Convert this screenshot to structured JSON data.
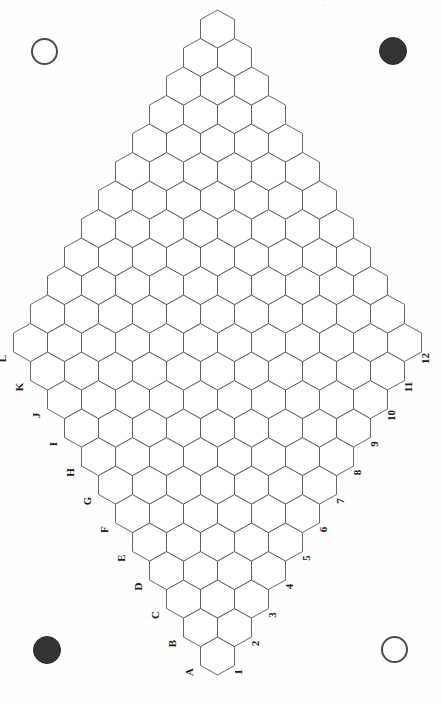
{
  "page": {
    "orientation": "rotated-90",
    "background_color": "#fefefe",
    "width": 441,
    "height": 704
  },
  "board": {
    "name": "hex-game-board",
    "shape": "rhombus",
    "rows": 12,
    "cols": 12,
    "cell_shape": "hexagon-pointy-top",
    "cell_width": 34,
    "cell_height": 38,
    "stroke_color": "#555555",
    "fill_color": "#ffffff",
    "stroke_width": 0.9,
    "origin": {
      "x": 217.5,
      "y": 656.0
    },
    "apex_top": {
      "x": 217.5,
      "y": 31.0
    },
    "apex_bottom": {
      "x": 217.5,
      "y": 675.0
    },
    "apex_left": {
      "x": 31.0,
      "y": 355.0
    },
    "apex_right": {
      "x": 404.0,
      "y": 350.0
    }
  },
  "labels": {
    "letters_axis_name": "row-letters",
    "letters": [
      "A",
      "B",
      "C",
      "D",
      "E",
      "F",
      "G",
      "H",
      "I",
      "J",
      "K",
      "L"
    ],
    "numbers_axis_name": "column-numbers",
    "numbers": [
      "1",
      "2",
      "3",
      "4",
      "5",
      "6",
      "7",
      "8",
      "9",
      "10",
      "11",
      "12"
    ],
    "font_size": 11,
    "color": "#1b1b1b",
    "rotation_deg": -90
  },
  "pieces": [
    {
      "id": "piece-top-left",
      "name": "piece-white-top-left",
      "color": "white",
      "hex": "#ffffff",
      "outline": "#4a4a4a",
      "x": 31,
      "y": 38,
      "d": 27
    },
    {
      "id": "piece-top-right",
      "name": "piece-black-top-right",
      "color": "black",
      "hex": "#333333",
      "outline": "#2a2a2a",
      "x": 379,
      "y": 37,
      "d": 28
    },
    {
      "id": "piece-bottom-left",
      "name": "piece-black-bottom-left",
      "color": "black",
      "hex": "#333333",
      "outline": "#2a2a2a",
      "x": 33,
      "y": 636,
      "d": 28
    },
    {
      "id": "piece-bottom-right",
      "name": "piece-white-bottom-right",
      "color": "white",
      "hex": "#ffffff",
      "outline": "#4a4a4a",
      "x": 381,
      "y": 636,
      "d": 27
    }
  ],
  "artifacts": {
    "top_smudge_text": "..",
    "top_smudge_note": "faint cut-off scan mark at top edge"
  }
}
